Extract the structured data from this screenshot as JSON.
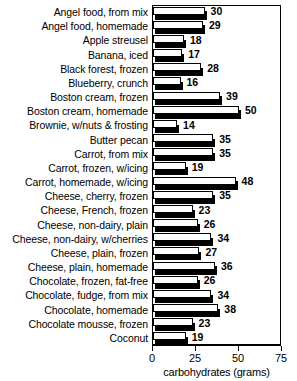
{
  "chart_data": {
    "type": "bar",
    "orientation": "horizontal",
    "title": "",
    "xlabel": "carbohydrates (grams)",
    "ylabel": "",
    "xlim": [
      0,
      75
    ],
    "xticks": [
      0,
      25,
      50,
      75
    ],
    "grid": false,
    "legend": null,
    "categories": [
      "Angel food, from mix",
      "Angel food, homemade",
      "Apple streusel",
      "Banana, iced",
      "Black forest, frozen",
      "Blueberry, crunch",
      "Boston cream, frozen",
      "Boston cream, homemade",
      "Brownie, w/nuts & frosting",
      "Butter pecan",
      "Carrot, from mix",
      "Carrot, frozen, w/icing",
      "Carrot, homemade, w/icing",
      "Cheese, cherry, frozen",
      "Cheese, French, frozen",
      "Cheese, non-dairy, plain",
      "Cheese, non-dairy, w/cherries",
      "Cheese, plain, frozen",
      "Cheese, plain, homemade",
      "Chocolate, frozen, fat-free",
      "Chocolate, fudge, from mix",
      "Chocolate, homemade",
      "Chocolate mousse, frozen",
      "Coconut"
    ],
    "values": [
      30,
      29,
      18,
      17,
      28,
      16,
      39,
      50,
      14,
      35,
      35,
      19,
      48,
      35,
      23,
      26,
      34,
      27,
      36,
      26,
      34,
      38,
      23,
      19
    ]
  },
  "axis": {
    "tick_labels": [
      "0",
      "25",
      "50",
      "75"
    ],
    "title": "carbohydrates (grams)"
  },
  "style": {
    "bar_face_color": "#ffffff",
    "bar_edge_color": "#000000",
    "bar_shadow_color": "#000000",
    "background": "#ffffff",
    "text_color": "#000000"
  }
}
